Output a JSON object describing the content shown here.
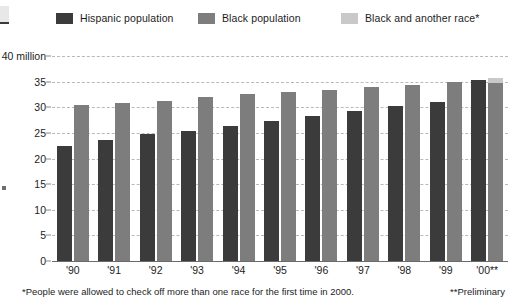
{
  "legend": {
    "items": [
      {
        "label": "Hispanic population",
        "color": "#3b3b3b",
        "icon": "legend-swatch-hispanic"
      },
      {
        "label": "Black population",
        "color": "#7d7d7d",
        "icon": "legend-swatch-black"
      },
      {
        "label": "Black and another race*",
        "color": "#c9c9c9",
        "icon": "legend-swatch-black-and-another-race"
      }
    ]
  },
  "footnote": {
    "left": "*People were allowed to check off more than one race for the first time in 2000.",
    "right": "**Preliminary"
  },
  "chart_data": {
    "type": "bar",
    "title": "",
    "subtitle": "",
    "xlabel": "",
    "ylabel": "",
    "ylim": [
      0,
      40
    ],
    "yticks": [
      "0",
      "5",
      "10",
      "15",
      "20",
      "25",
      "30",
      "35",
      "40 million"
    ],
    "ytick_values": [
      0,
      5,
      10,
      15,
      20,
      25,
      30,
      35,
      40
    ],
    "grid": true,
    "grid_style": "dashed-horizontal",
    "legend_position": "top",
    "stacked_last_group": true,
    "categories": [
      "'90",
      "'91",
      "'92",
      "'93",
      "'94",
      "'95",
      "'96",
      "'97",
      "'98",
      "'99",
      "'00**"
    ],
    "series": [
      {
        "name": "Hispanic population",
        "color": "#3b3b3b",
        "values": [
          22.5,
          23.6,
          24.7,
          25.4,
          26.3,
          27.3,
          28.3,
          29.2,
          30.2,
          31.1,
          35.3
        ]
      },
      {
        "name": "Black population",
        "color": "#7d7d7d",
        "values": [
          30.5,
          30.9,
          31.3,
          32.0,
          32.5,
          33.0,
          33.4,
          33.9,
          34.4,
          34.9,
          34.7
        ]
      },
      {
        "name": "Black and another race*",
        "color": "#c9c9c9",
        "values": [
          null,
          null,
          null,
          null,
          null,
          null,
          null,
          null,
          null,
          null,
          1.1
        ]
      }
    ]
  }
}
